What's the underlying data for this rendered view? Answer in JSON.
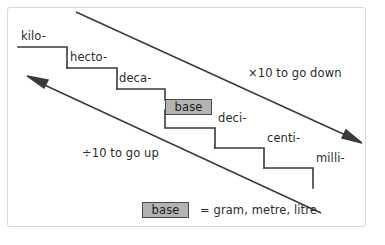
{
  "figure": {
    "background_color": "#ffffff",
    "frame_color": "#d8d8d8",
    "line_color": "#3a3a3a",
    "text_color": "#2b2b2b",
    "chip_fill_color": "#b3b3b3",
    "chip_border_color": "#4a4a4a"
  },
  "staircase": {
    "steps": [
      {
        "label": "kilo-",
        "is_base": false
      },
      {
        "label": "hecto-",
        "is_base": false
      },
      {
        "label": "deca-",
        "is_base": false
      },
      {
        "label": "base",
        "is_base": true
      },
      {
        "label": "deci-",
        "is_base": false
      },
      {
        "label": "centi-",
        "is_base": false
      },
      {
        "label": "milli-",
        "is_base": false
      }
    ]
  },
  "arrows": {
    "down": {
      "label": "×10 to go down",
      "direction": "down-right"
    },
    "up": {
      "label": "÷10 to go up",
      "direction": "up-left"
    }
  },
  "legend": {
    "chip_label": "base",
    "equals_text": "= gram, metre, litre"
  }
}
